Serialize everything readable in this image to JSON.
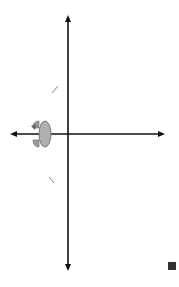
{
  "figure": {
    "type": "graph-of-functions",
    "y_axis_label": "f(x)",
    "x_axis_label": "x",
    "grid": {
      "columns_left_of_y_axis": 3,
      "columns_right_of_y_axis": 5,
      "rows_above_x_axis": 6,
      "rows_below_x_axis": 7,
      "cell_px": 19.5
    },
    "curves": [
      {
        "label": "f",
        "color": "#8a8a8a",
        "description": "decreasing exponential, passes (-1,2) and (0,1), asymptote y=0",
        "points": [
          [
            -2.2,
            6
          ],
          [
            -2,
            5
          ],
          [
            -1.8,
            4
          ],
          [
            -1.5,
            3
          ],
          [
            -1,
            2
          ],
          [
            -0.5,
            1.4
          ],
          [
            0,
            1
          ],
          [
            1,
            0.5
          ],
          [
            2,
            0.25
          ],
          [
            3,
            0.12
          ],
          [
            4,
            0.06
          ],
          [
            5,
            0.03
          ]
        ]
      },
      {
        "label": "h",
        "color": "#8a8a8a",
        "description": "reflection of f across x-axis, passes (-1,-2) and (0,-1)",
        "points": [
          [
            -2.7,
            -7
          ],
          [
            -2.5,
            -6
          ],
          [
            -2.2,
            -5
          ],
          [
            -2,
            -4
          ],
          [
            -1.5,
            -3
          ],
          [
            -1,
            -2
          ],
          [
            -0.5,
            -1.4
          ],
          [
            0,
            -1
          ],
          [
            1,
            -0.5
          ],
          [
            2,
            -0.25
          ],
          [
            3,
            -0.12
          ],
          [
            4,
            -0.06
          ],
          [
            5,
            -0.03
          ]
        ]
      }
    ],
    "annotations": [
      {
        "type": "reflection-rotation-icon",
        "position_units": [
          -2.3,
          0
        ],
        "color": "#a9a9a9"
      }
    ],
    "colors": {
      "grid": "#bdbdbd",
      "axis": "#111111",
      "curve": "#8a8a8a",
      "end_mark": "#333333"
    }
  }
}
